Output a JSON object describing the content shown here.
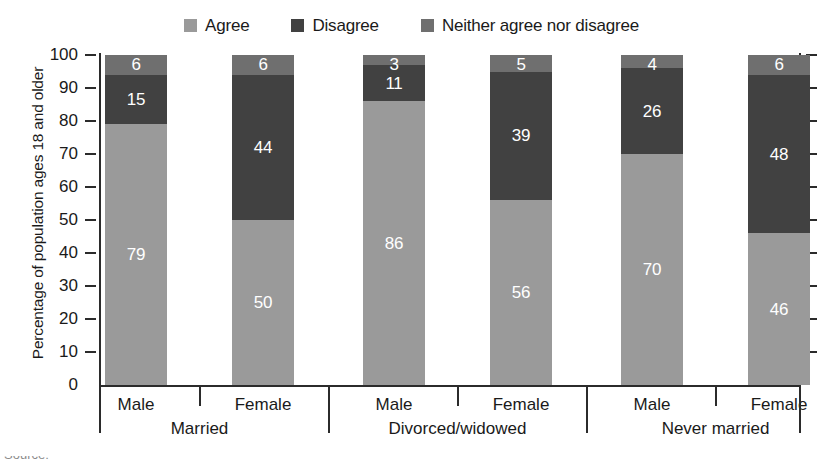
{
  "chart_data": {
    "type": "bar",
    "subtype": "stacked-bar-100",
    "title": "",
    "xlabel": "",
    "ylabel": "Percentage of population ages 18 and older",
    "ylim": [
      0,
      100
    ],
    "ytick_values": [
      0,
      10,
      20,
      30,
      40,
      50,
      60,
      70,
      80,
      90,
      100
    ],
    "ytick_labels": [
      "0",
      "10",
      "20",
      "30",
      "40",
      "50",
      "60",
      "70",
      "80",
      "90",
      "100"
    ],
    "grid": false,
    "legend_position": "top-center",
    "categories": [
      "Male",
      "Female",
      "Male",
      "Female",
      "Male",
      "Female"
    ],
    "groups": [
      {
        "label": "Married",
        "categories": [
          "Male",
          "Female"
        ]
      },
      {
        "label": "Divorced/widowed",
        "categories": [
          "Male",
          "Female"
        ]
      },
      {
        "label": "Never married",
        "categories": [
          "Male",
          "Female"
        ]
      }
    ],
    "series": [
      {
        "name": "Agree",
        "color": "#9a9a9a",
        "values": [
          79,
          50,
          86,
          56,
          70,
          46
        ]
      },
      {
        "name": "Disagree",
        "color": "#414141",
        "values": [
          15,
          44,
          11,
          39,
          26,
          48
        ]
      },
      {
        "name": "Neither agree nor disagree",
        "color": "#6f6f6f",
        "values": [
          6,
          6,
          3,
          5,
          4,
          6
        ]
      }
    ],
    "bars": [
      {
        "group": "Married",
        "category": "Male",
        "agree": 79,
        "disagree": 15,
        "neither": 6
      },
      {
        "group": "Married",
        "category": "Female",
        "agree": 50,
        "disagree": 44,
        "neither": 6
      },
      {
        "group": "Divorced/widowed",
        "category": "Male",
        "agree": 86,
        "disagree": 11,
        "neither": 3
      },
      {
        "group": "Divorced/widowed",
        "category": "Female",
        "agree": 56,
        "disagree": 39,
        "neither": 5
      },
      {
        "group": "Never married",
        "category": "Male",
        "agree": 70,
        "disagree": 26,
        "neither": 4
      },
      {
        "group": "Never married",
        "category": "Female",
        "agree": 46,
        "disagree": 48,
        "neither": 6
      }
    ]
  },
  "legend": {
    "items": [
      {
        "label": "Agree",
        "color": "#9a9a9a",
        "swatch_name": "legend-swatch-agree"
      },
      {
        "label": "Disagree",
        "color": "#414141",
        "swatch_name": "legend-swatch-disagree"
      },
      {
        "label": "Neither agree nor disagree",
        "color": "#6f6f6f",
        "swatch_name": "legend-swatch-neither"
      }
    ]
  },
  "axes": {
    "y_title": "Percentage of population ages 18 and older",
    "y_ticks": [
      "100",
      "90",
      "80",
      "70",
      "60",
      "50",
      "40",
      "30",
      "20",
      "10",
      "0"
    ]
  },
  "xaxis": {
    "sub_labels": [
      "Male",
      "Female",
      "Male",
      "Female",
      "Male",
      "Female"
    ],
    "group_labels": [
      "Married",
      "Divorced/widowed",
      "Never married"
    ]
  },
  "colors": {
    "agree": "#9a9a9a",
    "disagree": "#414141",
    "neither": "#6f6f6f",
    "axis": "#2b2b2b",
    "text": "#1a1a1a",
    "value_label": "#ffffff",
    "background": "#ffffff"
  },
  "cropped": {
    "top_partial": "",
    "source_partial": "Source:"
  }
}
